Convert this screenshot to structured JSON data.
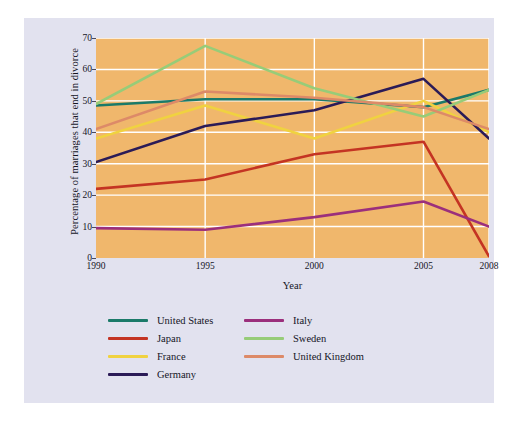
{
  "page": {
    "background_color": "#ffffff",
    "panel_color": "#e2e2ef"
  },
  "chart_data": {
    "type": "line",
    "title": "",
    "xlabel": "Year",
    "ylabel": "Percentage of marriages that end in divorce",
    "x": [
      1990,
      1995,
      2000,
      2005,
      2008
    ],
    "xtick_labels": [
      "1990",
      "1995",
      "2000",
      "2005",
      "2008"
    ],
    "ytick_labels": [
      "0",
      "10",
      "20",
      "30",
      "40",
      "50",
      "60",
      "70"
    ],
    "yticks": [
      0,
      10,
      20,
      30,
      40,
      50,
      60,
      70
    ],
    "ylim": [
      0,
      70
    ],
    "xlim": [
      1990,
      2008
    ],
    "grid": true,
    "grid_color": "#ffffff",
    "plot_background": "#f0b76c",
    "legend_position": "below",
    "series": [
      {
        "name": "United States",
        "color": "#1b7a69",
        "values": [
          48.5,
          50.5,
          50.5,
          48.0,
          53.5
        ]
      },
      {
        "name": "Japan",
        "color": "#c43423",
        "values": [
          22.0,
          25.0,
          33.0,
          37.0,
          0.5
        ]
      },
      {
        "name": "France",
        "color": "#f0d240",
        "values": [
          38.0,
          48.5,
          38.0,
          50.0,
          40.0
        ]
      },
      {
        "name": "Germany",
        "color": "#2b1b57",
        "values": [
          30.5,
          42.0,
          47.0,
          57.0,
          38.0
        ]
      },
      {
        "name": "Italy",
        "color": "#9b2f7c",
        "values": [
          9.5,
          9.0,
          13.0,
          18.0,
          10.0
        ]
      },
      {
        "name": "Sweden",
        "color": "#97cc78",
        "values": [
          49.0,
          67.5,
          54.0,
          45.0,
          53.5
        ]
      },
      {
        "name": "United Kingdom",
        "color": "#dd8a68",
        "values": [
          41.0,
          53.0,
          51.0,
          48.0,
          41.0
        ]
      }
    ]
  },
  "legend": {
    "columns": [
      [
        "United States",
        "Japan",
        "France",
        "Germany"
      ],
      [
        "Italy",
        "Sweden",
        "United Kingdom"
      ]
    ]
  }
}
